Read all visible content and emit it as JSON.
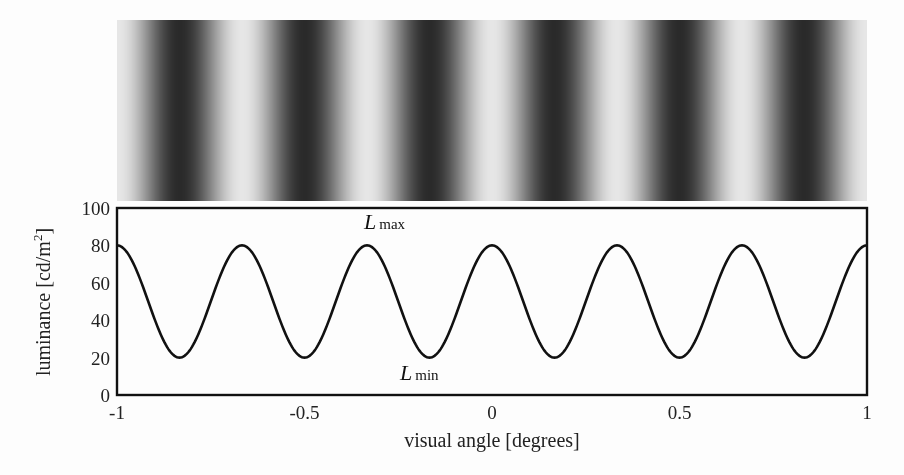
{
  "chart_data": {
    "type": "line",
    "title": "",
    "xlabel": "visual angle [degrees]",
    "ylabel": "luminance [cd/m²]",
    "ylabel_base": "luminance [cd/m",
    "ylabel_sup": "2",
    "ylabel_end": "]",
    "xlim": [
      -1,
      1
    ],
    "ylim": [
      0,
      100
    ],
    "xticks": [
      -1,
      -0.5,
      0,
      0.5,
      1
    ],
    "xtick_labels": [
      "-1",
      "-0.5",
      "0",
      "0.5",
      "1"
    ],
    "yticks": [
      0,
      20,
      40,
      60,
      80,
      100
    ],
    "ytick_labels": [
      "0",
      "20",
      "40",
      "60",
      "80",
      "100"
    ],
    "grid": false,
    "legend": null,
    "series": [
      {
        "name": "luminance profile",
        "function": "L = 50 + 30*cos(2*pi*3*x)",
        "mean": 50,
        "amplitude": 30,
        "frequency_cycles_per_degree": 3,
        "x": [
          -1,
          -0.8333,
          -0.6667,
          -0.5,
          -0.3333,
          -0.1667,
          0,
          0.1667,
          0.3333,
          0.5,
          0.6667,
          0.8333,
          1
        ],
        "values": [
          80,
          20,
          80,
          20,
          80,
          20,
          80,
          20,
          80,
          20,
          80,
          20,
          80
        ]
      }
    ],
    "annotations": [
      {
        "text": "L",
        "subscript": "max",
        "x": -0.3333,
        "y": 80,
        "position": "above"
      },
      {
        "text": "L",
        "subscript": "min",
        "x": -0.1667,
        "y": 20,
        "position": "below"
      }
    ],
    "stimulus_image": {
      "description": "sinusoidal luminance grating",
      "light_color": "#e6e6e6",
      "dark_color": "#2a2a2a"
    }
  }
}
